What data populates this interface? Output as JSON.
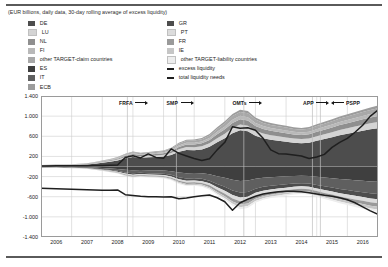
{
  "subtitle": "(EUR billions, daily data, 30-day rolling average of excess liquidity)",
  "colors": {
    "de": "#4d4d4d",
    "lu": "#d4d4d4",
    "nl": "#8f8f8f",
    "fi": "#b9b9b9",
    "other_claim": "#a8a8a8",
    "es": "#3f3f3f",
    "it": "#5f5f5f",
    "ecb": "#9c9c9c",
    "gr": "#4d4d4d",
    "pt": "#dcdcdc",
    "fr": "#9a9a9a",
    "ie": "#c6c6c6",
    "other_liability": "#ededed",
    "excess_liquidity": "#1f1f1f",
    "total_liquidity_needs": "#1f1f1f",
    "grid": "#cfcfcf",
    "axis": "#9a9a9a",
    "event_line": "#bdbdbd",
    "rule": "#5a5a5a"
  },
  "legend": {
    "left": [
      {
        "label": "DE",
        "swatch": "de",
        "type": "area"
      },
      {
        "label": "LU",
        "swatch": "lu",
        "type": "area"
      },
      {
        "label": "NL",
        "swatch": "nl",
        "type": "area"
      },
      {
        "label": "FI",
        "swatch": "fi",
        "type": "area"
      },
      {
        "label": "other TARGET-claim countries",
        "swatch": "other_claim",
        "type": "area"
      },
      {
        "label": "ES",
        "swatch": "es",
        "type": "area"
      },
      {
        "label": "IT",
        "swatch": "it",
        "type": "area"
      },
      {
        "label": "ECB",
        "swatch": "ecb",
        "type": "area"
      }
    ],
    "right": [
      {
        "label": "GR",
        "swatch": "gr",
        "type": "area"
      },
      {
        "label": "PT",
        "swatch": "pt",
        "type": "area"
      },
      {
        "label": "FR",
        "swatch": "fr",
        "type": "area"
      },
      {
        "label": "IE",
        "swatch": "ie",
        "type": "area"
      },
      {
        "label": "other TARGET-liability countries",
        "swatch": "other_liability",
        "type": "area"
      },
      {
        "label": "excess liquidity",
        "swatch": "excess_liquidity",
        "type": "line"
      },
      {
        "label": "total liquidity needs",
        "swatch": "total_liquidity_needs",
        "type": "line"
      }
    ]
  },
  "annotations": [
    {
      "label": "FRFA",
      "x": 2008.55,
      "dir": "right",
      "width": 30
    },
    {
      "label": "SMP",
      "x": 2010.1,
      "dir": "right",
      "width": 28
    },
    {
      "label": "OMTs",
      "x": 2012.25,
      "dir": "right",
      "width": 30
    },
    {
      "label": "APP",
      "x": 2014.55,
      "dir": "right",
      "width": 28
    },
    {
      "label": "PSPP",
      "x": 2015.45,
      "dir": "left",
      "width": 30
    }
  ],
  "event_lines": [
    2008.82,
    2010.42,
    2012.62,
    2014.86,
    2015.12
  ],
  "chart_data": {
    "type": "area",
    "title": "",
    "subtitle": "(EUR billions, daily data, 30-day rolling average of excess liquidity)",
    "xlabel": "",
    "ylabel": "",
    "xlim": [
      2006.0,
      2017.0
    ],
    "ylim": [
      -1400,
      1400
    ],
    "yticks": [
      1400,
      1000,
      600,
      200,
      -200,
      -600,
      -1000,
      -1400
    ],
    "ytick_labels": [
      "1.400",
      "1.000",
      "600",
      "200",
      "-200",
      "-600",
      "-1.000",
      "-1.400"
    ],
    "xticks": [
      2006,
      2007,
      2008,
      2009,
      2010,
      2011,
      2012,
      2013,
      2014,
      2015,
      2016
    ],
    "xtick_labels": [
      "2006",
      "2007",
      "2008",
      "2009",
      "2010",
      "2011",
      "2012",
      "2013",
      "2014",
      "2015",
      "2016"
    ],
    "grid": true,
    "legend_position": "top",
    "stacking": "signed-stacked",
    "x": [
      2006.0,
      2006.25,
      2006.5,
      2006.75,
      2007.0,
      2007.25,
      2007.5,
      2007.75,
      2008.0,
      2008.25,
      2008.5,
      2008.75,
      2009.0,
      2009.25,
      2009.5,
      2009.75,
      2010.0,
      2010.25,
      2010.5,
      2010.75,
      2011.0,
      2011.25,
      2011.5,
      2011.75,
      2012.0,
      2012.25,
      2012.5,
      2012.75,
      2013.0,
      2013.25,
      2013.5,
      2013.75,
      2014.0,
      2014.25,
      2014.5,
      2014.75,
      2015.0,
      2015.25,
      2015.5,
      2015.75,
      2016.0,
      2016.25,
      2016.5,
      2016.75,
      2017.0
    ],
    "series_positive": [
      {
        "name": "DE",
        "key": "de",
        "values": [
          22,
          24,
          26,
          28,
          30,
          34,
          40,
          55,
          75,
          95,
          120,
          165,
          190,
          175,
          185,
          190,
          200,
          230,
          295,
          330,
          325,
          340,
          390,
          480,
          560,
          660,
          720,
          700,
          610,
          560,
          530,
          510,
          490,
          470,
          460,
          470,
          510,
          545,
          580,
          620,
          650,
          680,
          710,
          740,
          760
        ]
      },
      {
        "name": "LU",
        "key": "lu",
        "values": [
          3,
          3,
          4,
          4,
          5,
          6,
          7,
          9,
          12,
          15,
          18,
          24,
          28,
          27,
          28,
          30,
          32,
          38,
          48,
          55,
          58,
          62,
          70,
          82,
          92,
          105,
          112,
          110,
          100,
          95,
          92,
          90,
          88,
          86,
          86,
          88,
          92,
          96,
          100,
          104,
          108,
          112,
          116,
          120,
          124
        ]
      },
      {
        "name": "NL",
        "key": "nl",
        "values": [
          2,
          2,
          3,
          3,
          4,
          5,
          6,
          8,
          11,
          14,
          18,
          24,
          28,
          26,
          27,
          29,
          31,
          36,
          46,
          52,
          55,
          58,
          66,
          78,
          88,
          100,
          106,
          104,
          95,
          90,
          87,
          85,
          83,
          81,
          80,
          82,
          86,
          90,
          94,
          98,
          102,
          106,
          110,
          114,
          118
        ]
      },
      {
        "name": "FI",
        "key": "fi",
        "values": [
          1,
          1,
          2,
          2,
          2,
          3,
          4,
          5,
          7,
          9,
          11,
          15,
          18,
          17,
          18,
          19,
          20,
          24,
          30,
          34,
          36,
          38,
          42,
          50,
          56,
          64,
          68,
          66,
          60,
          57,
          55,
          54,
          52,
          51,
          50,
          52,
          54,
          56,
          58,
          60,
          62,
          64,
          66,
          68,
          70
        ]
      },
      {
        "name": "other TARGET-claim countries",
        "key": "other_claim",
        "values": [
          2,
          2,
          2,
          3,
          3,
          4,
          5,
          6,
          8,
          10,
          13,
          17,
          20,
          19,
          20,
          21,
          23,
          27,
          34,
          38,
          40,
          43,
          48,
          56,
          63,
          72,
          77,
          75,
          68,
          64,
          62,
          60,
          59,
          58,
          57,
          58,
          61,
          64,
          67,
          70,
          73,
          76,
          79,
          82,
          85
        ]
      },
      {
        "name": "ECB",
        "key": "ecb",
        "values": [
          1,
          1,
          1,
          1,
          2,
          2,
          3,
          4,
          5,
          6,
          8,
          10,
          12,
          11,
          12,
          13,
          14,
          16,
          20,
          23,
          24,
          26,
          29,
          34,
          38,
          43,
          46,
          45,
          41,
          39,
          37,
          36,
          35,
          34,
          34,
          35,
          37,
          38,
          40,
          42,
          44,
          46,
          48,
          50,
          52
        ]
      }
    ],
    "series_negative": [
      {
        "name": "ES",
        "key": "es",
        "values": [
          -9,
          -10,
          -10,
          -11,
          -12,
          -14,
          -16,
          -22,
          -30,
          -38,
          -48,
          -66,
          -76,
          -70,
          -74,
          -76,
          -80,
          -92,
          -118,
          -132,
          -130,
          -136,
          -156,
          -192,
          -224,
          -264,
          -288,
          -280,
          -244,
          -224,
          -212,
          -204,
          -196,
          -188,
          -184,
          -188,
          -204,
          -218,
          -232,
          -248,
          -260,
          -272,
          -284,
          -296,
          -304
        ]
      },
      {
        "name": "IT",
        "key": "it",
        "values": [
          -7,
          -8,
          -8,
          -9,
          -10,
          -11,
          -13,
          -18,
          -24,
          -30,
          -38,
          -52,
          -60,
          -56,
          -59,
          -61,
          -64,
          -74,
          -94,
          -106,
          -104,
          -109,
          -125,
          -154,
          -180,
          -212,
          -230,
          -224,
          -196,
          -180,
          -170,
          -164,
          -157,
          -150,
          -147,
          -150,
          -163,
          -175,
          -186,
          -198,
          -208,
          -218,
          -227,
          -237,
          -243
        ]
      },
      {
        "name": "GR",
        "key": "gr",
        "values": [
          -3,
          -3,
          -3,
          -4,
          -4,
          -5,
          -6,
          -8,
          -10,
          -13,
          -16,
          -22,
          -26,
          -24,
          -25,
          -26,
          -27,
          -32,
          -40,
          -45,
          -44,
          -46,
          -53,
          -66,
          -77,
          -90,
          -98,
          -95,
          -83,
          -77,
          -73,
          -70,
          -67,
          -64,
          -63,
          -64,
          -69,
          -75,
          -79,
          -84,
          -89,
          -93,
          -97,
          -101,
          -104
        ]
      },
      {
        "name": "PT",
        "key": "pt",
        "values": [
          -2,
          -2,
          -2,
          -3,
          -3,
          -4,
          -4,
          -6,
          -8,
          -10,
          -12,
          -17,
          -20,
          -18,
          -19,
          -20,
          -21,
          -24,
          -30,
          -34,
          -34,
          -35,
          -40,
          -50,
          -58,
          -68,
          -74,
          -72,
          -63,
          -58,
          -55,
          -53,
          -51,
          -49,
          -48,
          -49,
          -53,
          -57,
          -60,
          -64,
          -67,
          -71,
          -74,
          -77,
          -79
        ]
      },
      {
        "name": "FR",
        "key": "fr",
        "values": [
          -2,
          -2,
          -2,
          -2,
          -3,
          -3,
          -4,
          -5,
          -7,
          -9,
          -11,
          -15,
          -17,
          -16,
          -17,
          -17,
          -18,
          -21,
          -27,
          -30,
          -30,
          -31,
          -36,
          -44,
          -51,
          -60,
          -66,
          -64,
          -56,
          -51,
          -49,
          -47,
          -45,
          -43,
          -43,
          -43,
          -47,
          -50,
          -53,
          -57,
          -59,
          -62,
          -65,
          -68,
          -70
        ]
      },
      {
        "name": "IE",
        "key": "ie",
        "values": [
          -1,
          -1,
          -2,
          -2,
          -2,
          -2,
          -3,
          -4,
          -5,
          -7,
          -9,
          -12,
          -14,
          -13,
          -13,
          -14,
          -15,
          -17,
          -21,
          -24,
          -24,
          -25,
          -29,
          -35,
          -41,
          -48,
          -52,
          -51,
          -45,
          -41,
          -39,
          -38,
          -36,
          -35,
          -34,
          -35,
          -38,
          -40,
          -43,
          -45,
          -47,
          -50,
          -52,
          -54,
          -56
        ]
      },
      {
        "name": "other TARGET-liability countries",
        "key": "other_liability",
        "values": [
          -1,
          -1,
          -1,
          -1,
          -2,
          -2,
          -2,
          -3,
          -4,
          -5,
          -7,
          -9,
          -11,
          -10,
          -10,
          -11,
          -11,
          -13,
          -16,
          -18,
          -18,
          -19,
          -22,
          -27,
          -31,
          -37,
          -40,
          -39,
          -34,
          -31,
          -30,
          -29,
          -28,
          -27,
          -26,
          -27,
          -29,
          -31,
          -33,
          -35,
          -36,
          -38,
          -40,
          -41,
          -43
        ]
      }
    ],
    "lines": [
      {
        "name": "excess liquidity",
        "key": "excess_liquidity",
        "values": [
          12,
          12,
          13,
          13,
          14,
          14,
          15,
          18,
          22,
          26,
          30,
          180,
          215,
          170,
          250,
          180,
          165,
          350,
          260,
          210,
          160,
          120,
          155,
          330,
          480,
          790,
          760,
          770,
          720,
          560,
          330,
          255,
          250,
          230,
          210,
          160,
          190,
          240,
          380,
          480,
          560,
          680,
          820,
          1000,
          1120
        ]
      },
      {
        "name": "total liquidity needs",
        "key": "total_liquidity_needs",
        "values": [
          -430,
          -435,
          -440,
          -445,
          -450,
          -455,
          -460,
          -465,
          -470,
          -470,
          -465,
          -560,
          -575,
          -590,
          -600,
          -600,
          -605,
          -600,
          -640,
          -625,
          -600,
          -580,
          -565,
          -620,
          -700,
          -870,
          -720,
          -650,
          -590,
          -545,
          -520,
          -500,
          -490,
          -490,
          -500,
          -520,
          -545,
          -570,
          -590,
          -620,
          -660,
          -720,
          -800,
          -880,
          -950
        ]
      }
    ]
  }
}
